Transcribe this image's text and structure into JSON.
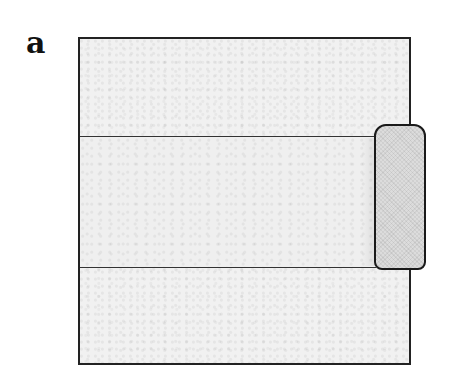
{
  "figure": {
    "panel_label": "a",
    "elements": [
      {
        "name": "sheet",
        "description": "square textured sheet outline"
      },
      {
        "name": "band",
        "description": "horizontal strip across sheet bounded by two lines"
      },
      {
        "name": "roller",
        "description": "rounded cylindrical roller at right end of strip"
      }
    ]
  }
}
